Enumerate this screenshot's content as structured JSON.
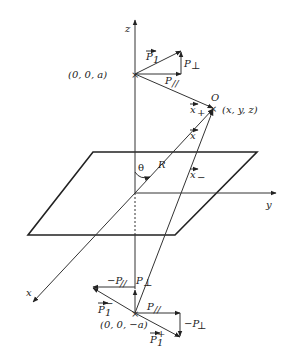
{
  "diagram": {
    "title": "",
    "axes": {
      "z_label": "z",
      "y_label": "y",
      "x_label": "x"
    },
    "points": {
      "upper_source": "(0, 0, a)",
      "lower_image": "(0, 0, −a)",
      "observer_letter": "O",
      "observer_coords": "(x, y, z)"
    },
    "upper_dipole": {
      "p1_label": "P",
      "p1_sub": "1",
      "p_parallel": "P",
      "p_parallel_sub": "//",
      "p_perp": "P",
      "p_perp_sub": "⊥"
    },
    "vectors": {
      "x_plus": "x",
      "x_plus_sub": "+",
      "x_vec": "x",
      "x_minus": "x",
      "x_minus_sub": "−",
      "R": "R",
      "theta": "θ"
    },
    "lower_dipoles": {
      "neg_p_parallel": "−P",
      "neg_p_parallel_sub": "//",
      "p_perp": "P",
      "p_perp_sub": "⊥",
      "p1_minus": "P",
      "p1_minus_sub": "1",
      "p1_minus_sup": "−",
      "p_parallel": "P",
      "p_parallel_sub": "//",
      "neg_p_perp": "−P",
      "neg_p_perp_sub": "⊥",
      "p1_plus": "P",
      "p1_plus_sub": "1",
      "p1_plus_sup": "+"
    }
  }
}
